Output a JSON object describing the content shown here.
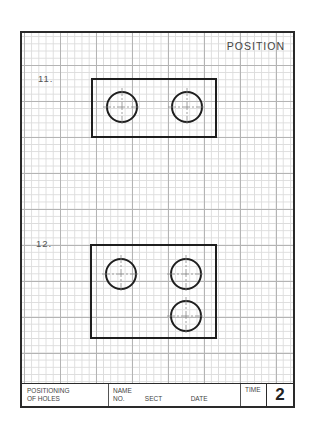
{
  "sheet": {
    "title": "POSITION",
    "problems": [
      {
        "label": "11.",
        "rect": {
          "x": 70,
          "y": 46,
          "w": 124,
          "h": 58
        },
        "holes": [
          {
            "cx": 100,
            "cy": 74,
            "r": 15
          },
          {
            "cx": 165,
            "cy": 74,
            "r": 15
          }
        ]
      },
      {
        "label": "12.",
        "rect": {
          "x": 69,
          "y": 212,
          "w": 125,
          "h": 93
        },
        "holes": [
          {
            "cx": 99,
            "cy": 241,
            "r": 15
          },
          {
            "cx": 164,
            "cy": 241,
            "r": 15
          },
          {
            "cx": 164,
            "cy": 283,
            "r": 15
          }
        ]
      }
    ]
  },
  "title_block": {
    "subject_line1": "POSITIONING",
    "subject_line2": "OF HOLES",
    "name_label": "NAME",
    "no_label": "NO.",
    "sect_label": "SECT",
    "date_label": "DATE",
    "time_label": "TIME",
    "sheet_number": "2"
  },
  "colors": {
    "line": "#1e1e1e",
    "grid_major": "#b4b4b4",
    "grid_minor": "#dcdcdc",
    "text": "#444444"
  }
}
